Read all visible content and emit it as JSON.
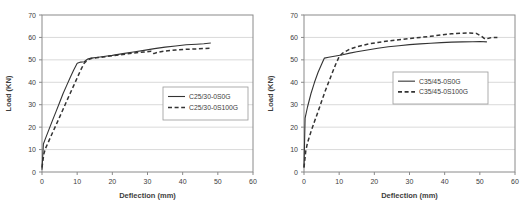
{
  "figure": {
    "background": "#ffffff"
  },
  "chart_data": [
    {
      "type": "line",
      "title": "",
      "xlabel": "Deflection (mm)",
      "ylabel": "Load (KN)",
      "xlim": [
        0,
        60
      ],
      "ylim": [
        0,
        70
      ],
      "xticks": [
        0,
        10,
        20,
        30,
        40,
        50,
        60
      ],
      "yticks": [
        0,
        10,
        20,
        30,
        40,
        50,
        60,
        70
      ],
      "grid": "horizontal",
      "legend_position": "middle-right",
      "legend_box": {
        "x": 163,
        "y": 87,
        "w": 85,
        "h": 33
      },
      "colors": {
        "line": "#333333",
        "grid": "#c9c9c9",
        "axis": "#8a8a8a",
        "text": "#3d3d3d",
        "legend_border": "#9a9a9a",
        "background": "#ffffff"
      },
      "series": [
        {
          "name": "C25/30-0S0G",
          "style": "solid",
          "points": [
            [
              0,
              1
            ],
            [
              0.4,
              12.5
            ],
            [
              1,
              15
            ],
            [
              2,
              19
            ],
            [
              3,
              23
            ],
            [
              4,
              27
            ],
            [
              5,
              31
            ],
            [
              6,
              35
            ],
            [
              7,
              38.5
            ],
            [
              8,
              42
            ],
            [
              9,
              45.5
            ],
            [
              10,
              48.5
            ],
            [
              11,
              49
            ],
            [
              12,
              49.2
            ],
            [
              13,
              50.4
            ],
            [
              14,
              50.8
            ],
            [
              16,
              51.2
            ],
            [
              18,
              51.6
            ],
            [
              20,
              52
            ],
            [
              23,
              52.8
            ],
            [
              26,
              53.5
            ],
            [
              29,
              54.2
            ],
            [
              32,
              55
            ],
            [
              35,
              55.7
            ],
            [
              38,
              56.2
            ],
            [
              41,
              56.7
            ],
            [
              44,
              57
            ],
            [
              46,
              57.2
            ],
            [
              48,
              57.5
            ]
          ]
        },
        {
          "name": "C25/30-0S100G",
          "style": "dashed",
          "points": [
            [
              0,
              2
            ],
            [
              0.5,
              8
            ],
            [
              1,
              10.5
            ],
            [
              2,
              14
            ],
            [
              3,
              17.5
            ],
            [
              4,
              21
            ],
            [
              5,
              24.5
            ],
            [
              6,
              28
            ],
            [
              7,
              31.5
            ],
            [
              8,
              35
            ],
            [
              9,
              38.5
            ],
            [
              10,
              42
            ],
            [
              11,
              45.5
            ],
            [
              12,
              48.5
            ],
            [
              13,
              50
            ],
            [
              14,
              50.6
            ],
            [
              16,
              51
            ],
            [
              18,
              51.4
            ],
            [
              20,
              51.8
            ],
            [
              23,
              52.4
            ],
            [
              26,
              53
            ],
            [
              29,
              53.5
            ],
            [
              31,
              53.8
            ],
            [
              31.8,
              52.8
            ],
            [
              33,
              53.4
            ],
            [
              35,
              53.9
            ],
            [
              38,
              54.4
            ],
            [
              41,
              54.7
            ],
            [
              44,
              54.9
            ],
            [
              48,
              55.2
            ]
          ]
        }
      ]
    },
    {
      "type": "line",
      "title": "",
      "xlabel": "Deflection (mm)",
      "ylabel": "Load (KN)",
      "xlim": [
        0,
        60
      ],
      "ylim": [
        0,
        70
      ],
      "xticks": [
        0,
        10,
        20,
        30,
        40,
        50,
        60
      ],
      "yticks": [
        0,
        10,
        20,
        30,
        40,
        50,
        60,
        70
      ],
      "grid": "horizontal",
      "legend_position": "middle-right",
      "legend_box": {
        "x": 131,
        "y": 72,
        "w": 95,
        "h": 32
      },
      "colors": {
        "line": "#333333",
        "grid": "#c9c9c9",
        "axis": "#8a8a8a",
        "text": "#3d3d3d",
        "legend_border": "#9a9a9a",
        "background": "#ffffff"
      },
      "series": [
        {
          "name": "C35/45-0S0G",
          "style": "solid",
          "points": [
            [
              0,
              2
            ],
            [
              0.3,
              24
            ],
            [
              1,
              29
            ],
            [
              2,
              35
            ],
            [
              3,
              40
            ],
            [
              4,
              44.5
            ],
            [
              5,
              48
            ],
            [
              5.8,
              50.8
            ],
            [
              7,
              51.2
            ],
            [
              9,
              51.7
            ],
            [
              11,
              52.3
            ],
            [
              13,
              53
            ],
            [
              15,
              53.6
            ],
            [
              18,
              54.4
            ],
            [
              21,
              55.2
            ],
            [
              24,
              55.8
            ],
            [
              27,
              56.3
            ],
            [
              30,
              56.8
            ],
            [
              33,
              57.1
            ],
            [
              36,
              57.4
            ],
            [
              39,
              57.7
            ],
            [
              42,
              57.9
            ],
            [
              45,
              58
            ],
            [
              48,
              58.1
            ],
            [
              50,
              58.2
            ],
            [
              52,
              58
            ]
          ]
        },
        {
          "name": "C35/45-0S100G",
          "style": "dashed",
          "points": [
            [
              0,
              2
            ],
            [
              0.5,
              9.5
            ],
            [
              1,
              13
            ],
            [
              2,
              18
            ],
            [
              3,
              22.5
            ],
            [
              4,
              27
            ],
            [
              5,
              31.5
            ],
            [
              6,
              36
            ],
            [
              7,
              40
            ],
            [
              8,
              44
            ],
            [
              9,
              48
            ],
            [
              10,
              51.5
            ],
            [
              11,
              53
            ],
            [
              13,
              54.8
            ],
            [
              15,
              55.8
            ],
            [
              18,
              57
            ],
            [
              21,
              57.8
            ],
            [
              24,
              58.4
            ],
            [
              27,
              59
            ],
            [
              30,
              59.5
            ],
            [
              33,
              60
            ],
            [
              36,
              60.5
            ],
            [
              39,
              61.1
            ],
            [
              42,
              61.6
            ],
            [
              45,
              61.9
            ],
            [
              47,
              62
            ],
            [
              49,
              61.8
            ],
            [
              50.5,
              60.5
            ],
            [
              51.5,
              59.3
            ],
            [
              52.5,
              59.6
            ],
            [
              53.5,
              60
            ],
            [
              55,
              60
            ]
          ]
        }
      ]
    }
  ]
}
